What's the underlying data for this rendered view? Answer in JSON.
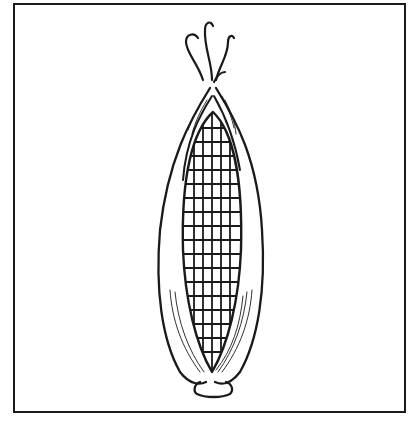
{
  "illustration": {
    "subject": "ear of corn",
    "description": "Black and white line drawing of an ear of corn with husk peeled open, inside a square border",
    "colors": {
      "stroke": "#1a1a1a",
      "background": "#ffffff"
    }
  }
}
